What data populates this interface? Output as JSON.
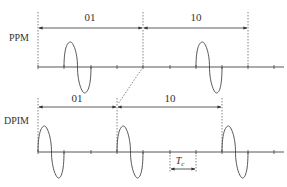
{
  "diagram": {
    "type": "pulse-modulation-comparison",
    "colors": {
      "line": "#444444",
      "dotted": "#666666",
      "text": "#333333"
    },
    "ppm": {
      "label": "PPM",
      "symbols": [
        {
          "bits": "01",
          "label": "01"
        },
        {
          "bits": "10",
          "label": "10"
        }
      ]
    },
    "dpim": {
      "label": "DPIM",
      "symbols": [
        {
          "bits": "01",
          "label": "01"
        },
        {
          "bits": "10",
          "label": "10"
        }
      ]
    },
    "slot_label": "T",
    "slot_label_sub": "c"
  }
}
